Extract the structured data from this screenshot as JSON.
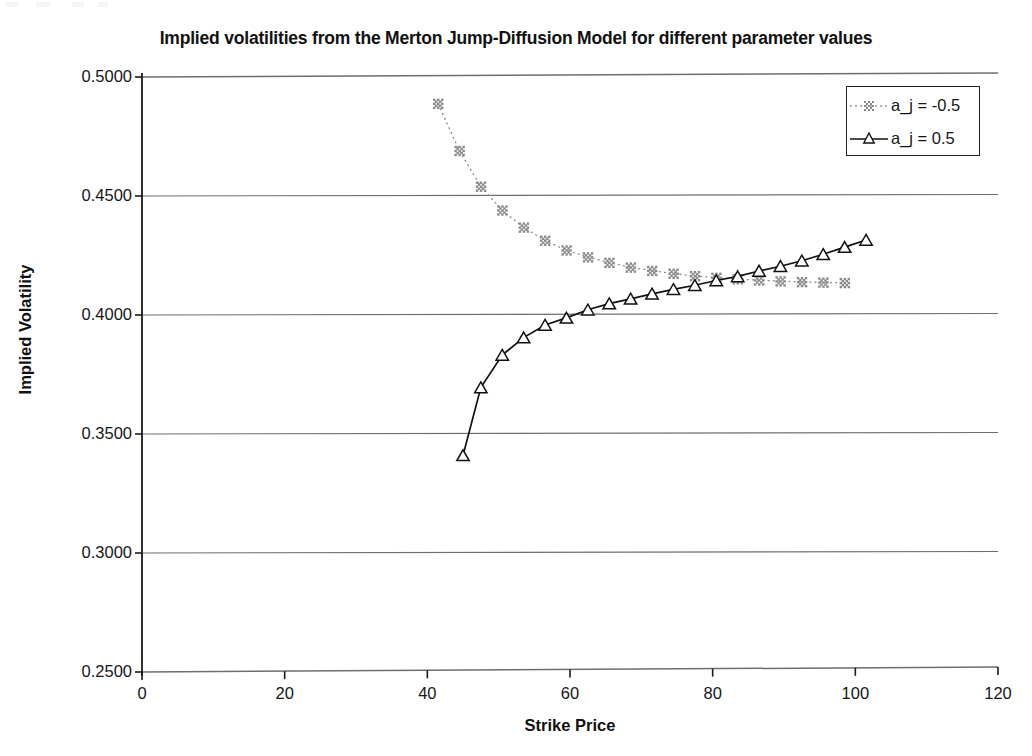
{
  "chart_data": {
    "type": "scatter",
    "title": "Implied volatilities from the Merton Jump-Diffusion Model for different parameter values",
    "xlabel": "Strike Price",
    "ylabel": "Implied Volatility",
    "xlim": [
      0,
      120
    ],
    "ylim": [
      0.25,
      0.5
    ],
    "xticks": [
      0,
      20,
      40,
      60,
      80,
      100,
      120
    ],
    "xtick_labels": [
      "0",
      "20",
      "40",
      "60",
      "80",
      "100",
      "120"
    ],
    "yticks": [
      0.25,
      0.3,
      0.35,
      0.4,
      0.45,
      0.5
    ],
    "ytick_labels": [
      "0.2500",
      "0.3000",
      "0.3500",
      "0.4000",
      "0.4500",
      "0.5000"
    ],
    "grid": "horizontal",
    "legend_position": "top-right",
    "series": [
      {
        "name": "a_j = -0.5",
        "marker": "asterisk",
        "linestyle": "dotted",
        "color": "#8a8a8a",
        "x": [
          41.5,
          44.5,
          47.5,
          50.5,
          53.5,
          56.5,
          59.5,
          62.5,
          65.5,
          68.5,
          71.5,
          74.5,
          77.5,
          80.5,
          83.5,
          86.5,
          89.5,
          92.5,
          95.5,
          98.5
        ],
        "y": [
          0.4888,
          0.469,
          0.454,
          0.444,
          0.4368,
          0.4313,
          0.4272,
          0.4243,
          0.422,
          0.42,
          0.4186,
          0.4174,
          0.4164,
          0.4157,
          0.4151,
          0.4146,
          0.4142,
          0.4139,
          0.4137,
          0.4135
        ]
      },
      {
        "name": "a_j = 0.5",
        "marker": "triangle",
        "linestyle": "solid",
        "color": "#111111",
        "x": [
          45.0,
          47.5,
          50.5,
          53.5,
          56.5,
          59.5,
          62.5,
          65.5,
          68.5,
          71.5,
          74.5,
          77.5,
          80.5,
          83.5,
          86.5,
          89.5,
          92.5,
          95.5,
          98.5,
          101.5
        ],
        "y": [
          0.341,
          0.3695,
          0.3832,
          0.3905,
          0.3958,
          0.3988,
          0.4022,
          0.4048,
          0.4068,
          0.4089,
          0.4108,
          0.4125,
          0.4145,
          0.4162,
          0.4185,
          0.4205,
          0.4228,
          0.4255,
          0.4285,
          0.4315
        ]
      }
    ]
  },
  "legend": {
    "entries": [
      {
        "label": "a_j = -0.5",
        "marker": "asterisk-marker",
        "line": "dotted"
      },
      {
        "label": "a_j = 0.5",
        "marker": "triangle-marker",
        "line": "solid"
      }
    ]
  },
  "colors": {
    "series_negative": "#8a8a8a",
    "series_positive": "#111111",
    "gridline": "#6e6e6e",
    "axis": "#1b1b1b",
    "background": "#ffffff"
  }
}
